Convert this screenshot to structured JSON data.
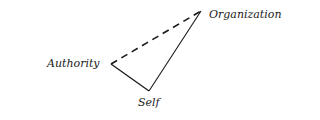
{
  "diagram": {
    "nodes": [
      {
        "id": "organization",
        "label": "Organization"
      },
      {
        "id": "authority",
        "label": "Authority"
      },
      {
        "id": "self",
        "label": "Self"
      }
    ],
    "edges": [
      {
        "from": "authority",
        "to": "organization",
        "style": "dashed"
      },
      {
        "from": "authority",
        "to": "self",
        "style": "solid"
      },
      {
        "from": "self",
        "to": "organization",
        "style": "solid"
      }
    ],
    "colors": {
      "line": "#1a1a1a",
      "background": "#ffffff"
    }
  }
}
